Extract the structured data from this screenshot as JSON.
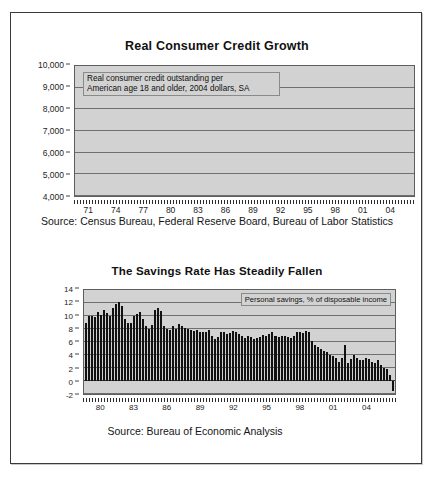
{
  "page": {
    "background": "#ffffff",
    "frame_color": "#3a3a3a"
  },
  "charts": [
    {
      "id": "credit",
      "title": "Real Consumer Credit Growth",
      "annotation": "Real consumer credit outstanding per\nAmerican age 18 and older, 2004 dollars, SA",
      "source": "Source: Census Bureau, Federal Reserve Board, Bureau of Labor Statistics",
      "yticks": [
        "10,000",
        "9,000",
        "8,000",
        "7,000",
        "6,000",
        "5,000",
        "4,000"
      ],
      "xticks": [
        "71",
        "74",
        "77",
        "80",
        "83",
        "86",
        "89",
        "92",
        "95",
        "98",
        "01",
        "04"
      ]
    },
    {
      "id": "savings",
      "title": "The Savings Rate Has Steadily Fallen",
      "annotation": "Personal savings, % of disposable income",
      "source": "Source: Bureau of Economic Analysis",
      "yticks": [
        "14",
        "12",
        "10",
        "8",
        "6",
        "4",
        "2",
        "0",
        "-2"
      ],
      "xticks": [
        "80",
        "83",
        "86",
        "89",
        "92",
        "95",
        "98",
        "01",
        "04"
      ]
    }
  ],
  "chart_data": [
    {
      "type": "bar",
      "title": "Real Consumer Credit Growth",
      "subtitle": "Real consumer credit outstanding per American age 18 and older, 2004 dollars, SA",
      "xlabel": "",
      "ylabel": "2004 dollars per adult",
      "ylim": [
        4000,
        10000
      ],
      "ytick_values": [
        4000,
        5000,
        6000,
        7000,
        8000,
        9000,
        10000
      ],
      "xtick_labels": [
        "71",
        "74",
        "77",
        "80",
        "83",
        "86",
        "89",
        "92",
        "95",
        "98",
        "01",
        "04"
      ],
      "grid": true,
      "legend": "none",
      "plot_background": "#d2d2d2",
      "bar_color": "#111111",
      "note": "Quarterly observations 1971Q1 through 2005Q2; values estimated from gridlines.",
      "x": [
        "1971Q1",
        "1971Q2",
        "1971Q3",
        "1971Q4",
        "1972Q1",
        "1972Q2",
        "1972Q3",
        "1972Q4",
        "1973Q1",
        "1973Q2",
        "1973Q3",
        "1973Q4",
        "1974Q1",
        "1974Q2",
        "1974Q3",
        "1974Q4",
        "1975Q1",
        "1975Q2",
        "1975Q3",
        "1975Q4",
        "1976Q1",
        "1976Q2",
        "1976Q3",
        "1976Q4",
        "1977Q1",
        "1977Q2",
        "1977Q3",
        "1977Q4",
        "1978Q1",
        "1978Q2",
        "1978Q3",
        "1978Q4",
        "1979Q1",
        "1979Q2",
        "1979Q3",
        "1979Q4",
        "1980Q1",
        "1980Q2",
        "1980Q3",
        "1980Q4",
        "1981Q1",
        "1981Q2",
        "1981Q3",
        "1981Q4",
        "1982Q1",
        "1982Q2",
        "1982Q3",
        "1982Q4",
        "1983Q1",
        "1983Q2",
        "1983Q3",
        "1983Q4",
        "1984Q1",
        "1984Q2",
        "1984Q3",
        "1984Q4",
        "1985Q1",
        "1985Q2",
        "1985Q3",
        "1985Q4",
        "1986Q1",
        "1986Q2",
        "1986Q3",
        "1986Q4",
        "1987Q1",
        "1987Q2",
        "1987Q3",
        "1987Q4",
        "1988Q1",
        "1988Q2",
        "1988Q3",
        "1988Q4",
        "1989Q1",
        "1989Q2",
        "1989Q3",
        "1989Q4",
        "1990Q1",
        "1990Q2",
        "1990Q3",
        "1990Q4",
        "1991Q1",
        "1991Q2",
        "1991Q3",
        "1991Q4",
        "1992Q1",
        "1992Q2",
        "1992Q3",
        "1992Q4",
        "1993Q1",
        "1993Q2",
        "1993Q3",
        "1993Q4",
        "1994Q1",
        "1994Q2",
        "1994Q3",
        "1994Q4",
        "1995Q1",
        "1995Q2",
        "1995Q3",
        "1995Q4",
        "1996Q1",
        "1996Q2",
        "1996Q3",
        "1996Q4",
        "1997Q1",
        "1997Q2",
        "1997Q3",
        "1997Q4",
        "1998Q1",
        "1998Q2",
        "1998Q3",
        "1998Q4",
        "1999Q1",
        "1999Q2",
        "1999Q3",
        "1999Q4",
        "2000Q1",
        "2000Q2",
        "2000Q3",
        "2000Q4",
        "2001Q1",
        "2001Q2",
        "2001Q3",
        "2001Q4",
        "2002Q1",
        "2002Q2",
        "2002Q3",
        "2002Q4",
        "2003Q1",
        "2003Q2",
        "2003Q3",
        "2003Q4",
        "2004Q1",
        "2004Q2",
        "2004Q3",
        "2004Q4",
        "2005Q1",
        "2005Q2"
      ],
      "values": [
        4280,
        4320,
        4380,
        4440,
        4520,
        4600,
        4680,
        4760,
        4850,
        4950,
        5030,
        5100,
        5160,
        5190,
        5200,
        5180,
        5130,
        5060,
        5000,
        4960,
        4940,
        4950,
        4980,
        5020,
        5080,
        5140,
        5200,
        5250,
        5300,
        5340,
        5370,
        5380,
        5370,
        5340,
        5300,
        5270,
        5240,
        5150,
        5080,
        5060,
        5080,
        5090,
        5070,
        5030,
        4990,
        4970,
        4970,
        5000,
        5060,
        5140,
        5230,
        5330,
        5430,
        5540,
        5650,
        5740,
        5820,
        5900,
        5960,
        6000,
        6030,
        6040,
        6050,
        6070,
        6090,
        6120,
        6160,
        6210,
        6260,
        6310,
        6360,
        6400,
        6430,
        6450,
        6450,
        6430,
        6390,
        6340,
        6280,
        6220,
        6150,
        6080,
        6010,
        5950,
        5900,
        5860,
        5840,
        5830,
        5830,
        5840,
        5870,
        5920,
        5990,
        6070,
        6160,
        6260,
        6370,
        6490,
        6600,
        6700,
        6800,
        6900,
        7000,
        7090,
        7180,
        7260,
        7340,
        7410,
        7480,
        7550,
        7620,
        7690,
        7760,
        7820,
        7880,
        7940,
        8000,
        8070,
        8140,
        8210,
        8280,
        8340,
        8390,
        8420,
        8450,
        8480,
        8540,
        8620,
        8700,
        8770,
        8830,
        8880,
        8930,
        8990,
        9060,
        9140,
        9230,
        9330,
        9440,
        9560,
        9680,
        9780
      ]
    },
    {
      "type": "bar",
      "title": "The Savings Rate Has Steadily Fallen",
      "subtitle": "Personal savings, % of disposable income",
      "xlabel": "",
      "ylabel": "% of disposable income",
      "ylim": [
        -2,
        14
      ],
      "ytick_values": [
        -2,
        0,
        2,
        4,
        6,
        8,
        10,
        12,
        14
      ],
      "xtick_labels": [
        "80",
        "83",
        "86",
        "89",
        "92",
        "95",
        "98",
        "01",
        "04"
      ],
      "grid": true,
      "legend": "none",
      "plot_background": "#d2d2d2",
      "bar_color": "#111111",
      "note": "Quarterly observations 1980Q1 through 2005Q3; values estimated from gridlines.",
      "x": [
        "1980Q1",
        "1980Q2",
        "1980Q3",
        "1980Q4",
        "1981Q1",
        "1981Q2",
        "1981Q3",
        "1981Q4",
        "1982Q1",
        "1982Q2",
        "1982Q3",
        "1982Q4",
        "1983Q1",
        "1983Q2",
        "1983Q3",
        "1983Q4",
        "1984Q1",
        "1984Q2",
        "1984Q3",
        "1984Q4",
        "1985Q1",
        "1985Q2",
        "1985Q3",
        "1985Q4",
        "1986Q1",
        "1986Q2",
        "1986Q3",
        "1986Q4",
        "1987Q1",
        "1987Q2",
        "1987Q3",
        "1987Q4",
        "1988Q1",
        "1988Q2",
        "1988Q3",
        "1988Q4",
        "1989Q1",
        "1989Q2",
        "1989Q3",
        "1989Q4",
        "1990Q1",
        "1990Q2",
        "1990Q3",
        "1990Q4",
        "1991Q1",
        "1991Q2",
        "1991Q3",
        "1991Q4",
        "1992Q1",
        "1992Q2",
        "1992Q3",
        "1992Q4",
        "1993Q1",
        "1993Q2",
        "1993Q3",
        "1993Q4",
        "1994Q1",
        "1994Q2",
        "1994Q3",
        "1994Q4",
        "1995Q1",
        "1995Q2",
        "1995Q3",
        "1995Q4",
        "1996Q1",
        "1996Q2",
        "1996Q3",
        "1996Q4",
        "1997Q1",
        "1997Q2",
        "1997Q3",
        "1997Q4",
        "1998Q1",
        "1998Q2",
        "1998Q3",
        "1998Q4",
        "1999Q1",
        "1999Q2",
        "1999Q3",
        "1999Q4",
        "2000Q1",
        "2000Q2",
        "2000Q3",
        "2000Q4",
        "2001Q1",
        "2001Q2",
        "2001Q3",
        "2001Q4",
        "2002Q1",
        "2002Q2",
        "2002Q3",
        "2002Q4",
        "2003Q1",
        "2003Q2",
        "2003Q3",
        "2003Q4",
        "2004Q1",
        "2004Q2",
        "2004Q3",
        "2004Q4",
        "2005Q1",
        "2005Q2",
        "2005Q3"
      ],
      "values": [
        9.0,
        10.0,
        10.0,
        9.8,
        10.6,
        10.2,
        10.9,
        10.4,
        10.0,
        11.2,
        11.8,
        12.2,
        11.5,
        9.6,
        9.0,
        8.9,
        10.0,
        10.3,
        10.6,
        9.5,
        8.4,
        8.0,
        8.6,
        11.0,
        11.3,
        10.8,
        8.4,
        8.0,
        7.8,
        8.5,
        8.0,
        8.8,
        8.4,
        8.2,
        8.0,
        7.8,
        7.7,
        7.8,
        7.6,
        7.5,
        7.6,
        7.8,
        7.0,
        6.4,
        6.8,
        7.6,
        7.5,
        7.2,
        7.4,
        7.7,
        7.5,
        7.3,
        6.9,
        6.6,
        7.0,
        6.7,
        6.4,
        6.6,
        6.8,
        7.1,
        7.0,
        7.2,
        7.5,
        7.0,
        6.8,
        6.9,
        7.0,
        6.8,
        6.6,
        6.9,
        7.6,
        7.5,
        7.4,
        7.7,
        7.6,
        6.1,
        5.5,
        5.2,
        5.0,
        4.6,
        4.4,
        4.0,
        3.8,
        3.5,
        3.0,
        3.6,
        5.6,
        2.8,
        3.4,
        4.0,
        3.6,
        3.2,
        3.3,
        3.5,
        3.4,
        3.0,
        2.8,
        3.2,
        2.4,
        2.0,
        1.8,
        0.9,
        -1.6
      ]
    }
  ]
}
